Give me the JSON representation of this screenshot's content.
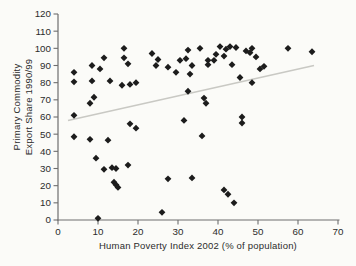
{
  "figure": {
    "background": "#fbfbf8"
  },
  "chart_data": {
    "type": "scatter",
    "title": "",
    "xlabel": "Human Poverty Index 2002 (% of population)",
    "ylabel_line1": "Primary Commodity",
    "ylabel_line2": "Export Share 1990/99",
    "xlim": [
      0,
      70
    ],
    "ylim": [
      0,
      120
    ],
    "x_ticks": [
      0,
      10,
      20,
      30,
      40,
      50,
      60,
      70
    ],
    "y_ticks": [
      0,
      10,
      20,
      30,
      40,
      50,
      60,
      70,
      80,
      90,
      100,
      110,
      120
    ],
    "grid": false,
    "legend": "none",
    "marker": "diamond",
    "points": [
      [
        4,
        86
      ],
      [
        4,
        80.5
      ],
      [
        4,
        61
      ],
      [
        4,
        48.5
      ],
      [
        8,
        47
      ],
      [
        8.5,
        90
      ],
      [
        8.5,
        81
      ],
      [
        8,
        68
      ],
      [
        9,
        71.5
      ],
      [
        10.5,
        88
      ],
      [
        11.5,
        94.5
      ],
      [
        9.5,
        36
      ],
      [
        10,
        1
      ],
      [
        11.5,
        29.5
      ],
      [
        12.5,
        46.5
      ],
      [
        13.5,
        30.5
      ],
      [
        14.5,
        30
      ],
      [
        13,
        81
      ],
      [
        16,
        78.5
      ],
      [
        18,
        79
      ],
      [
        19.5,
        80
      ],
      [
        16.5,
        100
      ],
      [
        16.5,
        94.5
      ],
      [
        17.5,
        91
      ],
      [
        17.5,
        32
      ],
      [
        18,
        56
      ],
      [
        19.5,
        53.5
      ],
      [
        14,
        22
      ],
      [
        14.5,
        20.5
      ],
      [
        15,
        19
      ],
      [
        23.5,
        97
      ],
      [
        25,
        93.5
      ],
      [
        24.5,
        90
      ],
      [
        26,
        4.5
      ],
      [
        27.5,
        89
      ],
      [
        27.5,
        24
      ],
      [
        29.5,
        86
      ],
      [
        30.5,
        93
      ],
      [
        31.5,
        58
      ],
      [
        32,
        94
      ],
      [
        32.5,
        99
      ],
      [
        32.5,
        75
      ],
      [
        33.5,
        90
      ],
      [
        33,
        85
      ],
      [
        33.5,
        24.5
      ],
      [
        35.5,
        100
      ],
      [
        36,
        49
      ],
      [
        36.5,
        71
      ],
      [
        37,
        68
      ],
      [
        37.5,
        93
      ],
      [
        39,
        93
      ],
      [
        37.5,
        90.5
      ],
      [
        39.5,
        96.5
      ],
      [
        40.5,
        101
      ],
      [
        42,
        99.5
      ],
      [
        41.5,
        95.5
      ],
      [
        43,
        101
      ],
      [
        44.5,
        100.5
      ],
      [
        43.5,
        90.5
      ],
      [
        45.5,
        83
      ],
      [
        47,
        98.5
      ],
      [
        48,
        97.5
      ],
      [
        48.5,
        100
      ],
      [
        49.5,
        95
      ],
      [
        50.5,
        88
      ],
      [
        51.5,
        89.5
      ],
      [
        48.5,
        80
      ],
      [
        46,
        60
      ],
      [
        46,
        56.5
      ],
      [
        41.5,
        17.5
      ],
      [
        42.5,
        15
      ],
      [
        44,
        10
      ],
      [
        57.5,
        100
      ],
      [
        63.5,
        98
      ]
    ],
    "trendline": {
      "x1": 2.5,
      "y1": 58,
      "x2": 64,
      "y2": 90
    },
    "colors": {
      "point": "#1c1c1c",
      "trend": "#c9c9c4",
      "axis": "#6e6e6e",
      "text": "#2b2b2b"
    }
  }
}
